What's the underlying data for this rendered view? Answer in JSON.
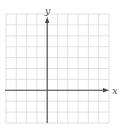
{
  "figure": {
    "type": "coordinate-grid"
  },
  "axes": {
    "x_label": "x",
    "y_label": "y"
  },
  "grid": {
    "columns": 10,
    "rows": 10,
    "y_axis_column_index": 4,
    "x_axis_row_index_from_top": 7,
    "left": 6,
    "top": 14,
    "cell_w": 10.3,
    "cell_h": 10.9
  },
  "colors": {
    "background": "#ffffff",
    "grid_line": "#d9d9d9",
    "axis_line": "#4a4a4a",
    "label": "#555555"
  }
}
